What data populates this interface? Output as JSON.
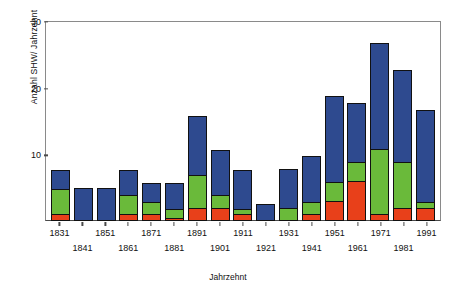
{
  "chart_data": {
    "type": "bar",
    "subtype": "stacked-vertical",
    "title": "",
    "xlabel": "Jahrzehnt",
    "ylabel": "Anzahl SHW/ Jahrzehnt",
    "categories": [
      "1831",
      "1841",
      "1851",
      "1861",
      "1871",
      "1881",
      "1891",
      "1901",
      "1911",
      "1921",
      "1931",
      "1941",
      "1951",
      "1961",
      "1971",
      "1981",
      "1991"
    ],
    "series": [
      {
        "name": "red",
        "color": "#e8401a",
        "values": [
          1,
          0,
          0,
          1,
          1,
          0.5,
          2,
          2,
          1,
          0,
          0,
          1,
          3,
          6,
          1,
          2,
          2
        ]
      },
      {
        "name": "green",
        "color": "#6aba3a",
        "values": [
          4,
          0,
          0,
          3,
          2,
          1.5,
          5,
          2,
          1,
          0,
          2,
          2,
          3,
          3,
          10,
          7,
          1
        ]
      },
      {
        "name": "blue",
        "color": "#2e4a8f",
        "values": [
          3,
          5,
          5,
          4,
          3,
          4,
          9,
          7,
          6,
          2.5,
          6,
          7,
          13,
          9,
          16,
          14,
          14
        ]
      }
    ],
    "totals": [
      8,
      5,
      5,
      8,
      6,
      6,
      16,
      11,
      8,
      2.5,
      8,
      10,
      19,
      18,
      27,
      23,
      17
    ],
    "ylim": [
      0,
      30
    ],
    "yticks": [
      0,
      10,
      20,
      30
    ],
    "ytick_labels": [
      "0",
      "10",
      "20",
      "30"
    ],
    "xtick_rows": [
      0,
      1,
      0,
      1,
      0,
      1,
      0,
      1,
      0,
      1,
      0,
      1,
      0,
      1,
      0,
      1,
      0
    ],
    "grid": false,
    "legend": "none",
    "axis_color": "#4a4a4a",
    "plot_background": "#ffffff"
  }
}
